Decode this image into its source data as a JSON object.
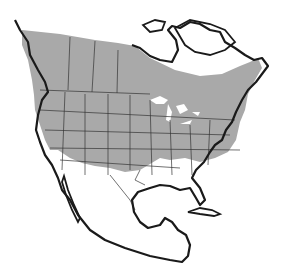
{
  "map": {
    "title": "North America range map",
    "region": "North America",
    "legend": {
      "range_label": "Range",
      "range_color": "#a9a9a9"
    },
    "colors": {
      "land": "#ffffff",
      "range": "#a9a9a9",
      "coastline": "#1a1a1a",
      "borders": "#333333",
      "water": "#ffffff"
    }
  }
}
